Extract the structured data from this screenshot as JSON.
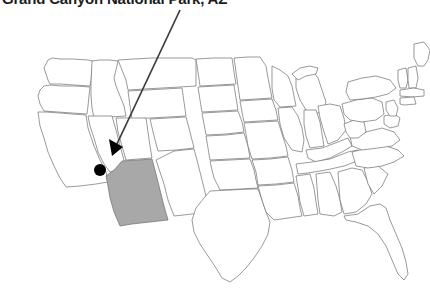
{
  "title": "Grand Canyon National Park, AZ",
  "map": {
    "name": "united-states-map",
    "highlighted_state": "AZ",
    "highlighted_state_name": "Arizona",
    "highlight_color": "#a8a8a8",
    "outline_color": "#6e6e6e",
    "background_color": "#ffffff",
    "marker": {
      "label": "Grand Canyon National Park",
      "color": "#000000",
      "x": 100,
      "y": 170,
      "radius": 6
    },
    "annotation_arrow": {
      "color": "#3a3a3a",
      "from_x": 180,
      "from_y": 10,
      "to_x": 112,
      "to_y": 155
    }
  }
}
